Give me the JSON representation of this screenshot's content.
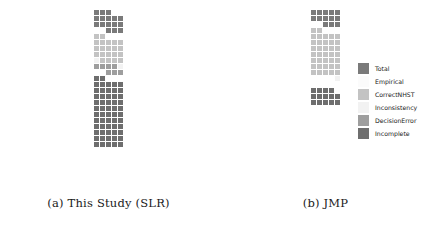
{
  "figure": {
    "type": "waffle-chart-figure",
    "panels": [
      {
        "id": "a",
        "caption": "(a) This Study (SLR)"
      },
      {
        "id": "b",
        "caption": "(b) JMP"
      }
    ]
  },
  "legend": {
    "position": "right",
    "items": [
      {
        "label": "Total",
        "color": "#7a7a7a"
      },
      {
        "label": "Empirical",
        "color": "#fbfbfb"
      },
      {
        "label": "CorrectNHST",
        "color": "#c3c3c3"
      },
      {
        "label": "Inconsistency",
        "color": "#f2f2f2"
      },
      {
        "label": "DecisionError",
        "color": "#9e9e9e"
      },
      {
        "label": "Incomplete",
        "color": "#6e6e6e"
      }
    ]
  },
  "chart_data": {
    "type": "bar",
    "subtype": "waffle",
    "title": "",
    "xlabel": "",
    "ylabel": "",
    "cell_value": 1,
    "columns_per_row": 5,
    "categories": [
      "Total",
      "Empirical",
      "CorrectNHST",
      "Inconsistency",
      "DecisionError",
      "Incomplete"
    ],
    "colors": [
      "#7a7a7a",
      "#fbfbfb",
      "#c3c3c3",
      "#f2f2f2",
      "#9e9e9e",
      "#6e6e6e"
    ],
    "series": [
      {
        "name": "(a) This Study (SLR)",
        "values": [
          57,
          0,
          21,
          2,
          7,
          16
        ]
      },
      {
        "name": "(b) JMP",
        "values": [
          65,
          0,
          37,
          1,
          0,
          14
        ]
      }
    ],
    "panel_a_blocks": [
      {
        "category": "Incomplete",
        "color": "#6e6e6e",
        "count": 57
      },
      {
        "category": "gap",
        "color": "transparent",
        "count": 5
      },
      {
        "category": "DecisionError",
        "color": "#9e9e9e",
        "count": 7
      },
      {
        "category": "Inconsistency",
        "color": "#f2f2f2",
        "count": 2
      },
      {
        "category": "CorrectNHST",
        "color": "#c3c3c3",
        "count": 21
      },
      {
        "category": "gap",
        "color": "transparent",
        "count": 5
      },
      {
        "category": "Total",
        "color": "#7a7a7a",
        "count": 16
      }
    ],
    "panel_b_blocks": [
      {
        "category": "Incomplete",
        "color": "#6e6e6e",
        "count": 14
      },
      {
        "category": "gap",
        "color": "transparent",
        "count": 10
      },
      {
        "category": "Inconsistency",
        "color": "#f2f2f2",
        "count": 1
      },
      {
        "category": "CorrectNHST",
        "color": "#c3c3c3",
        "count": 37
      },
      {
        "category": "gap",
        "color": "transparent",
        "count": 5
      },
      {
        "category": "Total",
        "color": "#7a7a7a",
        "count": 13
      }
    ],
    "grid": false,
    "legend_position": "right"
  }
}
